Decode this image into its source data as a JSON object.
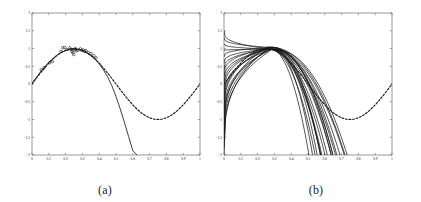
{
  "figure": {
    "background_color": "#ffffff",
    "line_color": "#1a1a1a",
    "axis_color": "#555555",
    "width": 421,
    "height": 202
  },
  "panels": [
    {
      "id": "a",
      "caption": "(a)",
      "chart_data": {
        "type": "line",
        "title": "",
        "xlabel": "",
        "ylabel": "",
        "xlim": [
          0,
          1
        ],
        "ylim": [
          -2,
          2
        ],
        "grid": false,
        "legend": "none",
        "xticks": [
          0,
          0.1,
          0.2,
          0.3,
          0.4,
          0.5,
          0.6,
          0.7,
          0.8,
          0.9,
          1
        ],
        "xticklabels": [
          "0",
          "0.1",
          "0.2",
          "0.3",
          "0.4",
          "0.5",
          "0.6",
          "0.7",
          "0.8",
          "0.9",
          "1"
        ],
        "yticks": [
          -2,
          -1.5,
          -1,
          -0.5,
          0,
          0.5,
          1,
          1.5,
          2
        ],
        "yticklabels": [
          "-2",
          "-1.5",
          "-1",
          "-0.5",
          "0",
          "0.5",
          "1",
          "1.5",
          "2"
        ],
        "series": [
          {
            "name": "true function (dashed)",
            "style": "dashed",
            "x": [
              0,
              0.025,
              0.05,
              0.075,
              0.1,
              0.125,
              0.15,
              0.175,
              0.2,
              0.225,
              0.25,
              0.275,
              0.3,
              0.325,
              0.35,
              0.375,
              0.4,
              0.425,
              0.45,
              0.475,
              0.5,
              0.525,
              0.55,
              0.575,
              0.6,
              0.625,
              0.65,
              0.675,
              0.7,
              0.725,
              0.75,
              0.775,
              0.8,
              0.825,
              0.85,
              0.875,
              0.9,
              0.925,
              0.95,
              0.975,
              1
            ],
            "y": [
              0,
              0.156,
              0.309,
              0.454,
              0.588,
              0.707,
              0.809,
              0.891,
              0.951,
              0.988,
              1,
              0.988,
              0.951,
              0.891,
              0.809,
              0.707,
              0.588,
              0.454,
              0.309,
              0.156,
              0,
              -0.156,
              -0.309,
              -0.454,
              -0.588,
              -0.707,
              -0.809,
              -0.891,
              -0.951,
              -0.988,
              -1,
              -0.988,
              -0.951,
              -0.891,
              -0.809,
              -0.707,
              -0.588,
              -0.454,
              -0.309,
              -0.156,
              0
            ]
          },
          {
            "name": "fitted model (solid)",
            "style": "solid",
            "x": [
              0,
              0.025,
              0.05,
              0.075,
              0.1,
              0.125,
              0.15,
              0.175,
              0.2,
              0.225,
              0.25,
              0.275,
              0.3,
              0.325,
              0.35,
              0.375,
              0.4,
              0.425,
              0.45,
              0.475,
              0.5,
              0.525,
              0.55,
              0.575,
              0.6,
              0.625
            ],
            "y": [
              0.02,
              0.18,
              0.34,
              0.48,
              0.61,
              0.72,
              0.82,
              0.89,
              0.94,
              0.97,
              0.98,
              0.965,
              0.93,
              0.875,
              0.8,
              0.7,
              0.57,
              0.4,
              0.2,
              -0.05,
              -0.35,
              -0.7,
              -1.08,
              -1.48,
              -1.88,
              -2.0
            ]
          }
        ],
        "scatter": {
          "name": "observed data points",
          "marker": "circle-open",
          "x": [
            0.055,
            0.072,
            0.105,
            0.122,
            0.172,
            0.183,
            0.195,
            0.208,
            0.225,
            0.232,
            0.238,
            0.243,
            0.248,
            0.252,
            0.258,
            0.263,
            0.272,
            0.288,
            0.296,
            0.305,
            0.312,
            0.322,
            0.335,
            0.352,
            0.368,
            0.382
          ],
          "y": [
            0.4,
            0.46,
            0.6,
            0.63,
            0.92,
            1.02,
            1.03,
            0.97,
            1.02,
            0.97,
            0.92,
            0.88,
            0.83,
            0.97,
            1.0,
            0.93,
            0.95,
            0.99,
            0.95,
            0.96,
            0.92,
            0.94,
            0.89,
            0.86,
            0.8,
            0.74
          ]
        }
      }
    },
    {
      "id": "b",
      "caption": "(b)",
      "chart_data": {
        "type": "line",
        "title": "",
        "xlabel": "",
        "ylabel": "",
        "xlim": [
          0,
          1
        ],
        "ylim": [
          -2,
          2
        ],
        "grid": false,
        "legend": "none",
        "xticks": [
          0,
          0.1,
          0.2,
          0.3,
          0.4,
          0.5,
          0.6,
          0.7,
          0.8,
          0.9,
          1
        ],
        "xticklabels": [
          "0",
          "0.1",
          "0.2",
          "0.3",
          "0.4",
          "0.5",
          "0.6",
          "0.7",
          "0.8",
          "0.9",
          "1"
        ],
        "yticks": [
          -2,
          -1.5,
          -1,
          -0.5,
          0,
          0.5,
          1,
          1.5,
          2
        ],
        "yticklabels": [
          "-2",
          "-1.5",
          "-1",
          "-0.5",
          "0",
          "0.5",
          "1",
          "1.5",
          "2"
        ],
        "series": [
          {
            "name": "true function (dashed)",
            "style": "dashed",
            "x": [
              0,
              0.025,
              0.05,
              0.075,
              0.1,
              0.125,
              0.15,
              0.175,
              0.2,
              0.225,
              0.25,
              0.275,
              0.3,
              0.325,
              0.35,
              0.375,
              0.4,
              0.425,
              0.45,
              0.475,
              0.5,
              0.525,
              0.55,
              0.575,
              0.6,
              0.625,
              0.65,
              0.675,
              0.7,
              0.725,
              0.75,
              0.775,
              0.8,
              0.825,
              0.85,
              0.875,
              0.9,
              0.925,
              0.95,
              0.975,
              1
            ],
            "y": [
              0,
              0.156,
              0.309,
              0.454,
              0.588,
              0.707,
              0.809,
              0.891,
              0.951,
              0.988,
              1,
              0.988,
              0.951,
              0.891,
              0.809,
              0.707,
              0.588,
              0.454,
              0.309,
              0.156,
              0,
              -0.156,
              -0.309,
              -0.454,
              -0.588,
              -0.707,
              -0.809,
              -0.891,
              -0.951,
              -0.988,
              -1,
              -0.988,
              -0.951,
              -0.891,
              -0.809,
              -0.707,
              -0.588,
              -0.454,
              -0.309,
              -0.156,
              0
            ]
          }
        ],
        "ensemble": {
          "name": "bootstrap fits (solid bundle)",
          "count": 20,
          "description": "Family of fitted curves that fan out near x=0 (spanning about -2 to 1.5), converge to a common peak near y=1 around x=0.25-0.3, then diverge downward crossing y=-2 between x=0.52 and x=0.72.",
          "x_start_spread": [
            -2.0,
            1.5
          ],
          "peak_x": 0.27,
          "peak_y": 1.0,
          "exit_x_range": [
            0.52,
            0.72
          ]
        }
      }
    }
  ]
}
